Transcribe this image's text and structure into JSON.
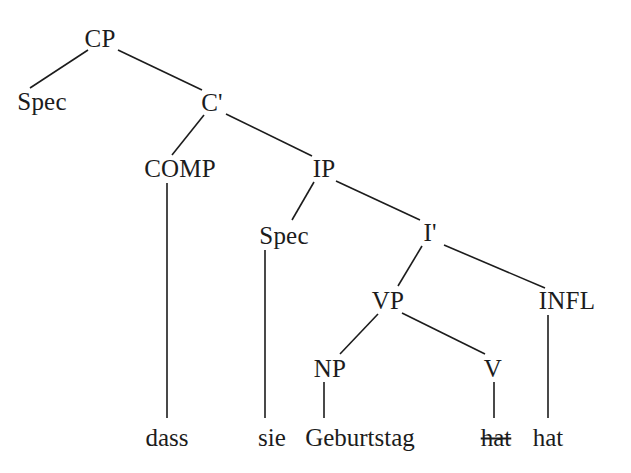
{
  "figure": {
    "kind": "syntax-tree",
    "framework": "x-bar",
    "language": "German",
    "sentence": "dass sie Geburtstag hat",
    "background_color": "#ffffff",
    "ink_color": "#1c1c1c",
    "width": 631,
    "height": 473
  },
  "nodes": [
    {
      "id": "cp",
      "label": "CP",
      "x": 100,
      "y": 38,
      "type": "phrase"
    },
    {
      "id": "cp_spec",
      "label": "Spec",
      "x": 42,
      "y": 101,
      "type": "specifier"
    },
    {
      "id": "cbar",
      "label": "C'",
      "x": 212,
      "y": 102,
      "type": "bar"
    },
    {
      "id": "comp",
      "label": "COMP",
      "x": 180,
      "y": 168,
      "type": "head"
    },
    {
      "id": "ip",
      "label": "IP",
      "x": 324,
      "y": 168,
      "type": "phrase"
    },
    {
      "id": "ip_spec",
      "label": "Spec",
      "x": 284,
      "y": 235,
      "type": "specifier"
    },
    {
      "id": "ibar",
      "label": "I'",
      "x": 430,
      "y": 232,
      "type": "bar"
    },
    {
      "id": "vp",
      "label": "VP",
      "x": 388,
      "y": 300,
      "type": "phrase"
    },
    {
      "id": "infl",
      "label": "INFL",
      "x": 567,
      "y": 300,
      "type": "head"
    },
    {
      "id": "np",
      "label": "NP",
      "x": 330,
      "y": 368,
      "type": "phrase"
    },
    {
      "id": "v",
      "label": "V",
      "x": 493,
      "y": 368,
      "type": "head"
    }
  ],
  "terminals": [
    {
      "id": "t_dass",
      "label": "dass",
      "x": 167,
      "y": 437,
      "struck": false,
      "parent": "comp"
    },
    {
      "id": "t_sie",
      "label": "sie",
      "x": 272,
      "y": 437,
      "struck": false,
      "parent": "ip_spec"
    },
    {
      "id": "t_geburtstag",
      "label": "Geburtstag",
      "x": 360,
      "y": 437,
      "struck": false,
      "parent": "np"
    },
    {
      "id": "t_hat_trace",
      "label": "hat",
      "x": 496,
      "y": 437,
      "struck": true,
      "parent": "v"
    },
    {
      "id": "t_hat",
      "label": "hat",
      "x": 548,
      "y": 437,
      "struck": false,
      "parent": "infl"
    }
  ],
  "edges": [
    {
      "id": "e_cp_spec",
      "from": "cp",
      "to": "cp_spec",
      "x1": 88,
      "y1": 50,
      "x2": 30,
      "y2": 88
    },
    {
      "id": "e_cp_cbar",
      "from": "cp",
      "to": "cbar",
      "x1": 118,
      "y1": 50,
      "x2": 202,
      "y2": 90
    },
    {
      "id": "e_cbar_comp",
      "from": "cbar",
      "to": "comp",
      "x1": 204,
      "y1": 115,
      "x2": 172,
      "y2": 155
    },
    {
      "id": "e_cbar_ip",
      "from": "cbar",
      "to": "ip",
      "x1": 226,
      "y1": 114,
      "x2": 312,
      "y2": 156
    },
    {
      "id": "e_comp_dass",
      "from": "comp",
      "to": "t_dass",
      "x1": 167,
      "y1": 183,
      "x2": 167,
      "y2": 418
    },
    {
      "id": "e_ip_spec",
      "from": "ip",
      "to": "ip_spec",
      "x1": 314,
      "y1": 182,
      "x2": 292,
      "y2": 220
    },
    {
      "id": "e_ip_ibar",
      "from": "ip",
      "to": "ibar",
      "x1": 336,
      "y1": 181,
      "x2": 420,
      "y2": 220
    },
    {
      "id": "e_spec_sie",
      "from": "ip_spec",
      "to": "t_sie",
      "x1": 265,
      "y1": 250,
      "x2": 265,
      "y2": 418
    },
    {
      "id": "e_ibar_vp",
      "from": "ibar",
      "to": "vp",
      "x1": 422,
      "y1": 246,
      "x2": 398,
      "y2": 286
    },
    {
      "id": "e_ibar_infl",
      "from": "ibar",
      "to": "infl",
      "x1": 444,
      "y1": 245,
      "x2": 545,
      "y2": 288
    },
    {
      "id": "e_vp_np",
      "from": "vp",
      "to": "np",
      "x1": 378,
      "y1": 314,
      "x2": 340,
      "y2": 354
    },
    {
      "id": "e_vp_v",
      "from": "vp",
      "to": "v",
      "x1": 402,
      "y1": 313,
      "x2": 485,
      "y2": 354
    },
    {
      "id": "e_np_geb",
      "from": "np",
      "to": "t_geburtstag",
      "x1": 324,
      "y1": 382,
      "x2": 324,
      "y2": 418
    },
    {
      "id": "e_v_hat",
      "from": "v",
      "to": "t_hat_trace",
      "x1": 494,
      "y1": 382,
      "x2": 494,
      "y2": 418
    },
    {
      "id": "e_infl_hat",
      "from": "infl",
      "to": "t_hat",
      "x1": 548,
      "y1": 315,
      "x2": 548,
      "y2": 418
    }
  ]
}
